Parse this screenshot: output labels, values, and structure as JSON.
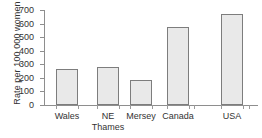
{
  "chart_data": {
    "type": "bar",
    "title": "",
    "xlabel": "",
    "ylabel": "Rate per 100 000 women",
    "categories": [
      "Wales",
      "NE Thames",
      "Mersey",
      "Canada",
      "USA"
    ],
    "category_lines": [
      [
        "Wales"
      ],
      [
        "NE",
        "Thames"
      ],
      [
        "Mersey"
      ],
      [
        "Canada"
      ],
      [
        "USA"
      ]
    ],
    "values": [
      265,
      280,
      185,
      575,
      670
    ],
    "ylim": [
      0,
      700
    ],
    "ytick_labels": [
      "0",
      "100",
      "200",
      "300",
      "400",
      "500",
      "600",
      "700"
    ],
    "ytick_values": [
      0,
      100,
      200,
      300,
      400,
      500,
      600,
      700
    ],
    "grid": false,
    "legend": "none",
    "bar_fill_color": "#e9e9e9",
    "bar_border_color": "#7d7d7d",
    "axis_color": "#8e8e8e"
  }
}
